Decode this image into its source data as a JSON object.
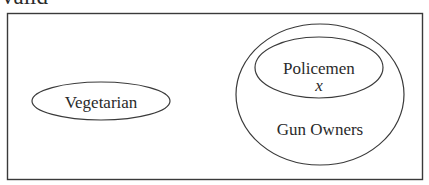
{
  "title": "valid",
  "diagram": {
    "type": "venn",
    "universe_box": {
      "x": 7,
      "y": 13,
      "width": 415,
      "height": 167
    },
    "sets": [
      {
        "id": "vegetarian",
        "label": "Vegetarian",
        "shape": "ellipse",
        "cx": 101,
        "cy": 101,
        "rx": 69,
        "ry": 19
      },
      {
        "id": "gun_owners",
        "label": "Gun Owners",
        "shape": "ellipse",
        "cx": 320,
        "cy": 94.5,
        "rx": 84,
        "ry": 70.5
      },
      {
        "id": "policemen",
        "label": "Policemen",
        "shape": "ellipse",
        "cx": 319,
        "cy": 67.5,
        "rx": 64,
        "ry": 30.5,
        "contained_in": "gun_owners"
      }
    ],
    "marker": {
      "label": "x",
      "in_set": "policemen"
    },
    "colors": {
      "stroke": "#3a3a3a",
      "text": "#2a2a2a",
      "background": "#ffffff"
    }
  }
}
